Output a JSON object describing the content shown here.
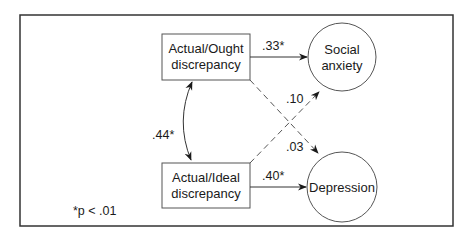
{
  "diagram": {
    "nodes": {
      "actual_ought": {
        "lines": [
          "Actual/Ought",
          "discrepancy"
        ],
        "shape": "rectangle"
      },
      "actual_ideal": {
        "lines": [
          "Actual/Ideal",
          "discrepancy"
        ],
        "shape": "rectangle"
      },
      "social_anxiety": {
        "lines": [
          "Social",
          "anxiety"
        ],
        "shape": "circle"
      },
      "depression": {
        "lines": [
          "Depression"
        ],
        "shape": "circle"
      }
    },
    "paths": {
      "ought_to_social": {
        "from": "Actual/Ought discrepancy",
        "to": "Social anxiety",
        "coefficient": ".33*",
        "style": "solid"
      },
      "ideal_to_depression": {
        "from": "Actual/Ideal discrepancy",
        "to": "Depression",
        "coefficient": ".40*",
        "style": "solid"
      },
      "ideal_to_social": {
        "from": "Actual/Ideal discrepancy",
        "to": "Social anxiety",
        "coefficient": ".10",
        "style": "dashed"
      },
      "ought_to_depression": {
        "from": "Actual/Ought discrepancy",
        "to": "Depression",
        "coefficient": ".03",
        "style": "dashed"
      },
      "correlation": {
        "between": [
          "Actual/Ought discrepancy",
          "Actual/Ideal discrepancy"
        ],
        "coefficient": ".44*",
        "style": "curved-double-arrow"
      }
    },
    "footnote": "*p < .01"
  }
}
